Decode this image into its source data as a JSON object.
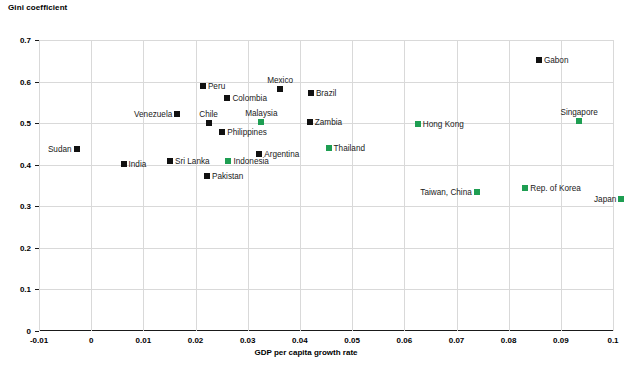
{
  "chart_data": {
    "type": "scatter",
    "title": "Gini coefficient",
    "xlabel": "GDP per capita growth rate",
    "ylabel": "Gini coefficient",
    "xlim": [
      -0.01,
      0.1
    ],
    "ylim": [
      0,
      0.7
    ],
    "xticks": [
      "-0.01",
      "0",
      "0.01",
      "0.02",
      "0.03",
      "0.04",
      "0.05",
      "0.06",
      "0.07",
      "0.08",
      "0.09",
      "0.1"
    ],
    "xtick_values": [
      -0.01,
      0,
      0.01,
      0.02,
      0.03,
      0.04,
      0.05,
      0.06,
      0.07,
      0.08,
      0.09,
      0.1
    ],
    "yticks": [
      "0",
      "0.1",
      "0.2",
      "0.3",
      "0.4",
      "0.5",
      "0.6",
      "0.7"
    ],
    "ytick_values": [
      0,
      0.1,
      0.2,
      0.3,
      0.4,
      0.5,
      0.6,
      0.7
    ],
    "grid": true,
    "legend": "none",
    "colors": {
      "dark": "#111111",
      "green": "#1e9e52",
      "grid": "#d9d9d9",
      "axis": "#1a1a1a"
    },
    "points": [
      {
        "name": "Sudan",
        "x": -0.0028,
        "y": 0.438,
        "color": "dark",
        "label_pos": "left"
      },
      {
        "name": "India",
        "x": 0.0062,
        "y": 0.403,
        "color": "dark",
        "label_pos": "right"
      },
      {
        "name": "Sri Lanka",
        "x": 0.0151,
        "y": 0.408,
        "color": "dark",
        "label_pos": "right"
      },
      {
        "name": "Venezuela",
        "x": 0.0165,
        "y": 0.523,
        "color": "dark",
        "label_pos": "left"
      },
      {
        "name": "Peru",
        "x": 0.0214,
        "y": 0.59,
        "color": "dark",
        "label_pos": "right"
      },
      {
        "name": "Pakistan",
        "x": 0.0222,
        "y": 0.374,
        "color": "dark",
        "label_pos": "right"
      },
      {
        "name": "Colombia",
        "x": 0.0261,
        "y": 0.561,
        "color": "dark",
        "label_pos": "right"
      },
      {
        "name": "Chile",
        "x": 0.0225,
        "y": 0.5,
        "color": "dark",
        "label_pos": "above"
      },
      {
        "name": "Philippines",
        "x": 0.0251,
        "y": 0.48,
        "color": "dark",
        "label_pos": "right"
      },
      {
        "name": "Indonesia",
        "x": 0.0263,
        "y": 0.41,
        "color": "green",
        "label_pos": "right"
      },
      {
        "name": "Argentina",
        "x": 0.0322,
        "y": 0.427,
        "color": "dark",
        "label_pos": "right"
      },
      {
        "name": "Malaysia",
        "x": 0.0326,
        "y": 0.503,
        "color": "green",
        "label_pos": "above"
      },
      {
        "name": "Mexico",
        "x": 0.0362,
        "y": 0.582,
        "color": "dark",
        "label_pos": "above"
      },
      {
        "name": "Brazil",
        "x": 0.0421,
        "y": 0.572,
        "color": "dark",
        "label_pos": "right"
      },
      {
        "name": "Zambia",
        "x": 0.0419,
        "y": 0.503,
        "color": "dark",
        "label_pos": "right"
      },
      {
        "name": "Thailand",
        "x": 0.0455,
        "y": 0.44,
        "color": "green",
        "label_pos": "right"
      },
      {
        "name": "Hong Kong",
        "x": 0.0626,
        "y": 0.497,
        "color": "green",
        "label_pos": "right"
      },
      {
        "name": "Taiwan, China",
        "x": 0.0739,
        "y": 0.334,
        "color": "green",
        "label_pos": "left"
      },
      {
        "name": "Gabon",
        "x": 0.0858,
        "y": 0.652,
        "color": "dark",
        "label_pos": "right"
      },
      {
        "name": "Rep. of Korea",
        "x": 0.0832,
        "y": 0.345,
        "color": "green",
        "label_pos": "right"
      },
      {
        "name": "Singapore",
        "x": 0.0935,
        "y": 0.505,
        "color": "green",
        "label_pos": "above"
      },
      {
        "name": "Japan",
        "x": 0.1016,
        "y": 0.317,
        "color": "green",
        "label_pos": "left"
      }
    ]
  }
}
